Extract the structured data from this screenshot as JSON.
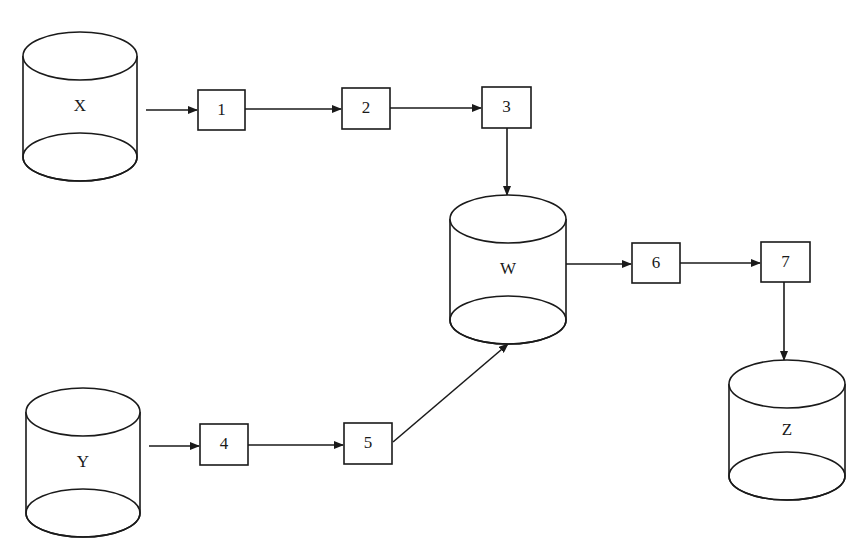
{
  "diagram": {
    "type": "data-flow",
    "colors": {
      "stroke": "#1a1a1a",
      "background": "#ffffff"
    },
    "stores": [
      {
        "id": "X",
        "label": "X",
        "cx": 80,
        "top": 32,
        "rx": 57,
        "ry": 24,
        "height": 125
      },
      {
        "id": "Y",
        "label": "Y",
        "cx": 83,
        "top": 388,
        "rx": 57,
        "ry": 24,
        "height": 125
      },
      {
        "id": "W",
        "label": "W",
        "cx": 508,
        "top": 195,
        "rx": 58,
        "ry": 24,
        "height": 125
      },
      {
        "id": "Z",
        "label": "Z",
        "cx": 787,
        "top": 360,
        "rx": 58,
        "ry": 24,
        "height": 116
      }
    ],
    "processes": [
      {
        "id": "1",
        "label": "1",
        "x": 198,
        "y": 90,
        "w": 47,
        "h": 40
      },
      {
        "id": "2",
        "label": "2",
        "x": 342,
        "y": 88,
        "w": 48,
        "h": 41
      },
      {
        "id": "3",
        "label": "3",
        "x": 482,
        "y": 87,
        "w": 49,
        "h": 41
      },
      {
        "id": "4",
        "label": "4",
        "x": 200,
        "y": 424,
        "w": 48,
        "h": 41
      },
      {
        "id": "5",
        "label": "5",
        "x": 344,
        "y": 423,
        "w": 48,
        "h": 41
      },
      {
        "id": "6",
        "label": "6",
        "x": 632,
        "y": 243,
        "w": 48,
        "h": 40
      },
      {
        "id": "7",
        "label": "7",
        "x": 761,
        "y": 242,
        "w": 49,
        "h": 40
      }
    ],
    "edges": [
      {
        "from": "X",
        "to": "1",
        "x1": 146,
        "y1": 110,
        "x2": 197,
        "y2": 110
      },
      {
        "from": "1",
        "to": "2",
        "x1": 245,
        "y1": 109,
        "x2": 341,
        "y2": 109
      },
      {
        "from": "2",
        "to": "3",
        "x1": 390,
        "y1": 108,
        "x2": 481,
        "y2": 108
      },
      {
        "from": "3",
        "to": "W",
        "x1": 507,
        "y1": 128,
        "x2": 507,
        "y2": 195
      },
      {
        "from": "Y",
        "to": "4",
        "x1": 149,
        "y1": 446,
        "x2": 199,
        "y2": 446
      },
      {
        "from": "4",
        "to": "5",
        "x1": 248,
        "y1": 445,
        "x2": 343,
        "y2": 445
      },
      {
        "from": "5",
        "to": "W",
        "x1": 393,
        "y1": 442,
        "x2": 508,
        "y2": 344
      },
      {
        "from": "W",
        "to": "6",
        "x1": 566,
        "y1": 264,
        "x2": 631,
        "y2": 264
      },
      {
        "from": "6",
        "to": "7",
        "x1": 680,
        "y1": 263,
        "x2": 760,
        "y2": 263
      },
      {
        "from": "7",
        "to": "Z",
        "x1": 784,
        "y1": 282,
        "x2": 784,
        "y2": 360
      }
    ]
  }
}
